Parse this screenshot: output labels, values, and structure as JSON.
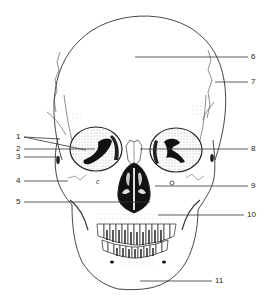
{
  "diagram": {
    "line_color": "#333333",
    "stipple_color": "#555555",
    "labels": [
      {
        "id": "1",
        "text": "1",
        "x": 18,
        "y": 140,
        "targets": [
          [
            60,
            139
          ],
          [
            86,
            150
          ]
        ]
      },
      {
        "id": "2",
        "text": "2",
        "x": 18,
        "y": 152,
        "targets": [
          [
            95,
            149
          ]
        ]
      },
      {
        "id": "3",
        "text": "3",
        "x": 18,
        "y": 160,
        "targets": [
          [
            60,
            157
          ]
        ]
      },
      {
        "id": "4",
        "text": "4",
        "x": 18,
        "y": 184,
        "targets": [
          [
            68,
            181
          ]
        ]
      },
      {
        "id": "5",
        "text": "5",
        "x": 18,
        "y": 205,
        "targets": [
          [
            150,
            202
          ]
        ]
      },
      {
        "id": "6",
        "text": "6",
        "x": 252,
        "y": 60,
        "targets": [
          [
            135,
            57
          ]
        ]
      },
      {
        "id": "7",
        "text": "7",
        "x": 252,
        "y": 85,
        "targets": [
          [
            215,
            82
          ]
        ]
      },
      {
        "id": "8",
        "text": "8",
        "x": 252,
        "y": 152,
        "targets": [
          [
            140,
            149
          ]
        ]
      },
      {
        "id": "9",
        "text": "9",
        "x": 252,
        "y": 189,
        "targets": [
          [
            155,
            186
          ]
        ]
      },
      {
        "id": "10",
        "text": "10",
        "x": 250,
        "y": 218,
        "targets": [
          [
            158,
            215
          ]
        ]
      },
      {
        "id": "11",
        "text": "11",
        "x": 216,
        "y": 284,
        "targets": [
          [
            140,
            281
          ]
        ]
      }
    ]
  }
}
